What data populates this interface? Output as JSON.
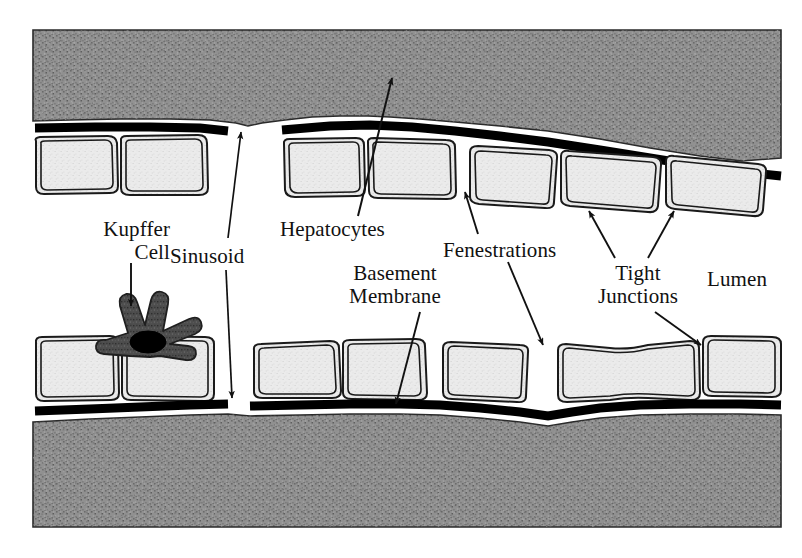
{
  "figure": {
    "background_color": "#ffffff"
  },
  "colors": {
    "tissue_gray": "#8d8d8d",
    "tissue_gray_dark": "#7a7a7a",
    "cell_fill": "#e9e9e9",
    "membrane_black": "#000000",
    "kupffer_body": "#4a4a4a",
    "kupffer_nucleus": "#000000",
    "outline": "#1a1a1a",
    "label_text": "#111111"
  },
  "labels": {
    "kupffer_cell": "Kupffer\nCell",
    "sinusoid": "Sinusoid",
    "hepatocytes": "Hepatocytes",
    "basement_membrane": "Basement\nMembrane",
    "fenestrations": "Fenestrations",
    "tight_junctions": "Tight\nJunctions",
    "lumen": "Lumen"
  },
  "structures": {
    "hepatocyte_tissue_top": "upper gray stippled hepatocyte mass",
    "hepatocyte_tissue_bottom": "lower gray stippled hepatocyte mass",
    "basement_membrane_top": "thick black line beneath upper hepatocyte mass",
    "basement_membrane_bottom": "thick black line above lower hepatocyte mass",
    "endothelial_cells_top_count": 7,
    "endothelial_cells_bottom_count": 7,
    "kupffer_cell": "dark star-shaped macrophage with black nucleus resting on lower endothelium",
    "sinusoid_lumen": "open white channel between the two endothelial cell layers"
  },
  "annotations": [
    {
      "name": "kupffer-cell-annotation",
      "label_key": "kupffer_cell",
      "arrowheads": 1,
      "points_to": "kupffer-cell"
    },
    {
      "name": "sinusoid-annotation",
      "label_key": "sinusoid",
      "arrowheads": 2,
      "points_to": "sinusoid-lumen-top-and-bottom"
    },
    {
      "name": "hepatocytes-annotation",
      "label_key": "hepatocytes",
      "arrowheads": 1,
      "points_to": "upper-hepatocyte-tissue"
    },
    {
      "name": "basement-membrane-annotation",
      "label_key": "basement_membrane",
      "arrowheads": 1,
      "points_to": "lower-basement-membrane"
    },
    {
      "name": "fenestrations-annotation",
      "label_key": "fenestrations",
      "arrowheads": 2,
      "points_to": "gaps-between-endothelial-cells"
    },
    {
      "name": "tight-junctions-annotation",
      "label_key": "tight_junctions",
      "arrowheads": 3,
      "points_to": "endothelial-cell-cell-contacts"
    },
    {
      "name": "lumen-annotation",
      "label_key": "lumen",
      "arrowheads": 0,
      "points_to": "sinusoid-interior"
    }
  ]
}
